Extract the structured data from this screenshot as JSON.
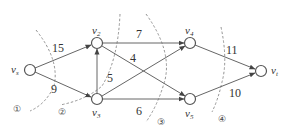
{
  "diagram": {
    "type": "flow-network-with-cuts",
    "nodes": [
      {
        "id": "vs",
        "label": "v",
        "sub": "s",
        "x": 30,
        "y": 70
      },
      {
        "id": "v2",
        "label": "v",
        "sub": "2",
        "x": 97,
        "y": 43
      },
      {
        "id": "v3",
        "label": "v",
        "sub": "3",
        "x": 97,
        "y": 99
      },
      {
        "id": "v4",
        "label": "v",
        "sub": "4",
        "x": 190,
        "y": 43
      },
      {
        "id": "v5",
        "label": "v",
        "sub": "5",
        "x": 190,
        "y": 99
      },
      {
        "id": "vt",
        "label": "v",
        "sub": "t",
        "x": 261,
        "y": 71
      }
    ],
    "edges": [
      {
        "from": "vs",
        "to": "v2",
        "capacity": "15"
      },
      {
        "from": "vs",
        "to": "v3",
        "capacity": "9"
      },
      {
        "from": "v3",
        "to": "v2",
        "capacity": ""
      },
      {
        "from": "v2",
        "to": "v4",
        "capacity": "7"
      },
      {
        "from": "v2",
        "to": "v5",
        "capacity": "4"
      },
      {
        "from": "v3",
        "to": "v4",
        "capacity": "5"
      },
      {
        "from": "v3",
        "to": "v5",
        "capacity": "6"
      },
      {
        "from": "v4",
        "to": "vt",
        "capacity": "11"
      },
      {
        "from": "v5",
        "to": "vt",
        "capacity": "10"
      }
    ],
    "cuts": [
      {
        "label": "①"
      },
      {
        "label": "②"
      },
      {
        "label": "③"
      },
      {
        "label": "④"
      }
    ]
  }
}
